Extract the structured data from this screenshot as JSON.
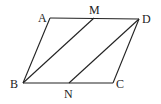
{
  "diagram": {
    "type": "parallelogram",
    "points": {
      "A": {
        "x": 50,
        "y": 18,
        "label": "A",
        "lx": 38,
        "ly": 22
      },
      "M": {
        "x": 94,
        "y": 18,
        "label": "M",
        "lx": 89,
        "ly": 14
      },
      "D": {
        "x": 139,
        "y": 19,
        "label": "D",
        "lx": 142,
        "ly": 23
      },
      "B": {
        "x": 23,
        "y": 83,
        "label": "B",
        "lx": 11,
        "ly": 88
      },
      "N": {
        "x": 69,
        "y": 83,
        "label": "N",
        "lx": 64,
        "ly": 98
      },
      "C": {
        "x": 113,
        "y": 83,
        "label": "C",
        "lx": 116,
        "ly": 88
      }
    },
    "segments": [
      [
        "A",
        "D"
      ],
      [
        "D",
        "C"
      ],
      [
        "C",
        "B"
      ],
      [
        "B",
        "A"
      ],
      [
        "B",
        "M"
      ],
      [
        "N",
        "D"
      ]
    ],
    "labels": {
      "A": "A",
      "M": "M",
      "D": "D",
      "B": "B",
      "N": "N",
      "C": "C"
    }
  }
}
